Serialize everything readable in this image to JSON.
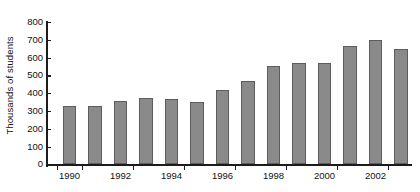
{
  "chart_data": {
    "type": "bar",
    "title": "",
    "xlabel": "",
    "ylabel": "Thousands of students",
    "ylim": [
      0,
      800
    ],
    "yticks": [
      0,
      100,
      200,
      300,
      400,
      500,
      600,
      700,
      800
    ],
    "ytick_labels": [
      "0",
      "100",
      "200",
      "300",
      "400",
      "500",
      "600",
      "700",
      "800"
    ],
    "grid": false,
    "legend": null,
    "bar_color": "#8a8a8a",
    "bar_edge_color": "#5c5c5c",
    "axis_color": "#1c1c1c",
    "categories": [
      "1990",
      "1991",
      "1992",
      "1993",
      "1994",
      "1995",
      "1996",
      "1997",
      "1998",
      "1999",
      "2000",
      "2001",
      "2002",
      "2003"
    ],
    "xtick_labels": [
      "1990",
      "1992",
      "1994",
      "1996",
      "1998",
      "2000",
      "2002"
    ],
    "values": [
      330,
      330,
      355,
      375,
      365,
      350,
      420,
      470,
      555,
      570,
      570,
      665,
      700,
      650
    ]
  }
}
